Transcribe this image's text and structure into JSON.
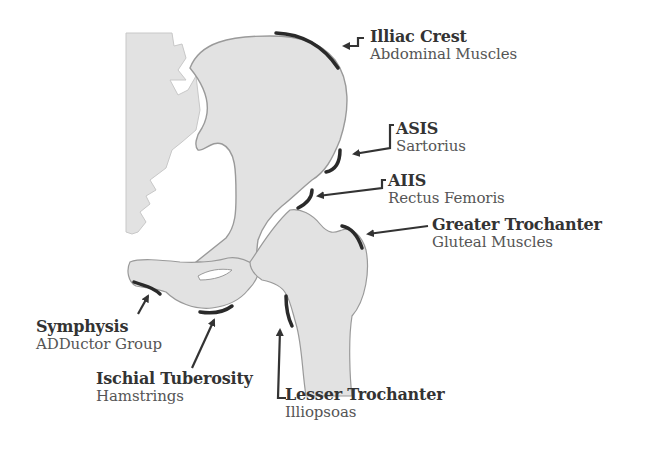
{
  "diagram": {
    "colors": {
      "bone_fill": "#e2e2e2",
      "bone_outline": "#9a9a9a",
      "attachment_marker": "#2a2a2a",
      "arrow": "#333333",
      "title_text": "#333333",
      "subtitle_text": "#555555"
    },
    "labels": [
      {
        "id": "illiac-crest",
        "title": "Illiac Crest",
        "muscle": "Abdominal Muscles"
      },
      {
        "id": "asis",
        "title": "ASIS",
        "muscle": "Sartorius"
      },
      {
        "id": "aiis",
        "title": "AIIS",
        "muscle": "Rectus Femoris"
      },
      {
        "id": "greater-trochanter",
        "title": "Greater Trochanter",
        "muscle": "Gluteal Muscles"
      },
      {
        "id": "symphysis",
        "title": "Symphysis",
        "muscle": "ADDuctor Group"
      },
      {
        "id": "ischial-tuberosity",
        "title": "Ischial Tuberosity",
        "muscle": "Hamstrings"
      },
      {
        "id": "lesser-trochanter",
        "title": "Lesser Trochanter",
        "muscle": "Illiopsoas"
      }
    ]
  }
}
